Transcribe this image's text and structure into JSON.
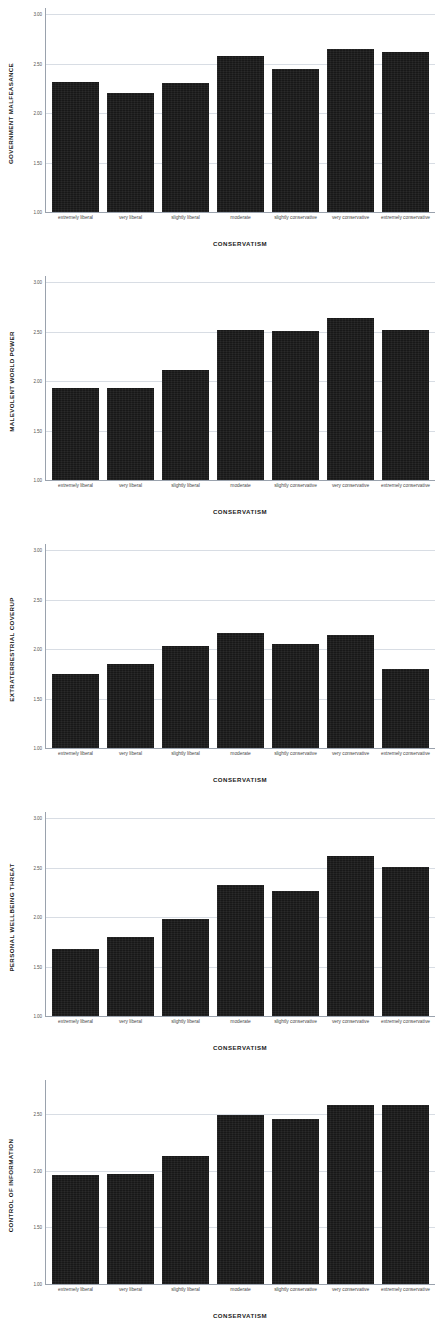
{
  "figure": {
    "background_color": "#ffffff",
    "bar_color": "#181818",
    "gridline_color": "#d8dde4",
    "axis_color": "#9aa2ad",
    "xaxis_title": "CONSERVATISM",
    "categories": [
      "extremely liberal",
      "very liberal",
      "slightly liberal",
      "moderate",
      "slightly conservative",
      "very conservative",
      "extremely conservative"
    ]
  },
  "chart_data": [
    {
      "type": "bar",
      "title": "",
      "ylabel": "GOVERNMENT MALFEASANCE",
      "xlabel": "CONSERVATISM",
      "categories": [
        "extremely liberal",
        "very liberal",
        "slightly liberal",
        "moderate",
        "slightly conservative",
        "very conservative",
        "extremely conservative"
      ],
      "values": [
        2.31,
        2.2,
        2.3,
        2.58,
        2.44,
        2.65,
        2.62
      ],
      "ylim": [
        1.0,
        3.0
      ],
      "yticks": [
        1.0,
        1.5,
        2.0,
        2.5,
        3.0
      ],
      "ytick_labels": [
        "1.00",
        "1.50",
        "2.00",
        "2.50",
        "3.00"
      ],
      "grid": true,
      "legend": "none"
    },
    {
      "type": "bar",
      "title": "",
      "ylabel": "MALEVOLENT WORLD POWER",
      "xlabel": "CONSERVATISM",
      "categories": [
        "extremely liberal",
        "very liberal",
        "slightly liberal",
        "moderate",
        "slightly conservative",
        "very conservative",
        "extremely conservative"
      ],
      "values": [
        1.93,
        1.93,
        2.11,
        2.52,
        2.51,
        2.64,
        2.52
      ],
      "ylim": [
        1.0,
        3.0
      ],
      "yticks": [
        1.0,
        1.5,
        2.0,
        2.5,
        3.0
      ],
      "ytick_labels": [
        "1.00",
        "1.50",
        "2.00",
        "2.50",
        "3.00"
      ],
      "grid": true,
      "legend": "none"
    },
    {
      "type": "bar",
      "title": "",
      "ylabel": "EXTRATERRESTRIAL COVERUP",
      "xlabel": "CONSERVATISM",
      "categories": [
        "extremely liberal",
        "very liberal",
        "slightly liberal",
        "moderate",
        "slightly conservative",
        "very conservative",
        "extremely conservative"
      ],
      "values": [
        1.75,
        1.85,
        2.03,
        2.16,
        2.05,
        2.14,
        1.8
      ],
      "ylim": [
        1.0,
        3.0
      ],
      "yticks": [
        1.0,
        1.5,
        2.0,
        2.5,
        3.0
      ],
      "ytick_labels": [
        "1.00",
        "1.50",
        "2.00",
        "2.50",
        "3.00"
      ],
      "grid": true,
      "legend": "none"
    },
    {
      "type": "bar",
      "title": "",
      "ylabel": "PERSONAL WELLBEING THREAT",
      "xlabel": "CONSERVATISM",
      "categories": [
        "extremely liberal",
        "very liberal",
        "slightly liberal",
        "moderate",
        "slightly conservative",
        "very conservative",
        "extremely conservative"
      ],
      "values": [
        1.68,
        1.8,
        1.98,
        2.32,
        2.26,
        2.62,
        2.51
      ],
      "ylim": [
        1.0,
        3.0
      ],
      "yticks": [
        1.0,
        1.5,
        2.0,
        2.5,
        3.0
      ],
      "ytick_labels": [
        "1.00",
        "1.50",
        "2.00",
        "2.50",
        "3.00"
      ],
      "grid": true,
      "legend": "none"
    },
    {
      "type": "bar",
      "title": "",
      "ylabel": "CONTROL OF INFORMATION",
      "xlabel": "CONSERVATISM",
      "categories": [
        "extremely liberal",
        "very liberal",
        "slightly liberal",
        "moderate",
        "slightly conservative",
        "very conservative",
        "extremely conservative"
      ],
      "values": [
        1.96,
        1.97,
        2.13,
        2.49,
        2.46,
        2.58,
        2.58
      ],
      "ylim": [
        1.0,
        2.75
      ],
      "yticks": [
        1.0,
        1.5,
        2.0,
        2.5
      ],
      "ytick_labels": [
        "1.00",
        "1.50",
        "2.00",
        "2.50"
      ],
      "grid": true,
      "legend": "none"
    }
  ]
}
